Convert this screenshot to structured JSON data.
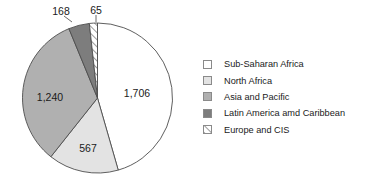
{
  "chart_data": {
    "type": "pie",
    "title": "",
    "categories": [
      "Sub-Saharan Africa",
      "North Africa",
      "Asia and Pacific",
      "Latin America amd Caribbean",
      "Europe and CIS"
    ],
    "values": [
      1706,
      567,
      1240,
      168,
      65
    ],
    "value_labels": [
      "1,706",
      "567",
      "1,240",
      "168",
      "65"
    ],
    "total": 3746,
    "legend_position": "right",
    "grid": false,
    "start_angle_deg": 0,
    "direction": "clockwise",
    "slice_styles": [
      {
        "name": "Sub-Saharan Africa",
        "fill": "#ffffff",
        "stroke": "#4d4d4d",
        "pattern": "solid"
      },
      {
        "name": "North Africa",
        "fill": "#e3e3e3",
        "stroke": "#4d4d4d",
        "pattern": "solid"
      },
      {
        "name": "Asia and Pacific",
        "fill": "#b0b0b0",
        "stroke": "#4d4d4d",
        "pattern": "solid"
      },
      {
        "name": "Latin America amd Caribbean",
        "fill": "#7d7d7d",
        "stroke": "#4d4d4d",
        "pattern": "solid"
      },
      {
        "name": "Europe and CIS",
        "fill": "#ffffff",
        "stroke": "#4d4d4d",
        "pattern": "diagonal-hatch"
      }
    ]
  },
  "legend": {
    "items": [
      {
        "label": "Sub-Saharan Africa"
      },
      {
        "label": "North Africa"
      },
      {
        "label": "Asia and Pacific"
      },
      {
        "label": "Latin America amd Caribbean"
      },
      {
        "label": "Europe and CIS"
      }
    ]
  },
  "labels": {
    "sub_saharan_africa": "1,706",
    "north_africa": "567",
    "asia_and_pacific": "1,240",
    "latin_america_and_caribbean": "168",
    "europe_and_cis": "65"
  },
  "colors": {
    "outline": "#4d4d4d",
    "text": "#1a1a1a",
    "swatch_border": "#8a8a8a",
    "slice_sub_saharan_africa": "#ffffff",
    "slice_north_africa": "#e3e3e3",
    "slice_asia_and_pacific": "#b0b0b0",
    "slice_latin_america": "#7d7d7d",
    "slice_europe_cis": "#ffffff"
  }
}
